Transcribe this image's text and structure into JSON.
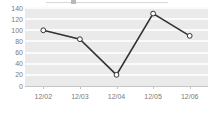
{
  "chart_data": {
    "type": "line",
    "title": "",
    "xlabel": "",
    "ylabel": "",
    "categories": [
      "12/02",
      "12/03",
      "12/04",
      "12/05",
      "12/06"
    ],
    "values": [
      100,
      84,
      20,
      130,
      90
    ],
    "series": [
      {
        "name": "",
        "values": [
          100,
          84,
          20,
          130,
          90
        ]
      }
    ],
    "ylim": [
      0,
      140
    ],
    "yticks": [
      0,
      20,
      40,
      60,
      80,
      100,
      120,
      140
    ],
    "ytick_labels": [
      "0",
      "20",
      "40",
      "60",
      "80",
      "100",
      "120",
      "140"
    ],
    "grid": true,
    "grid_axis": "y",
    "legend": false,
    "legend_position": "none",
    "marker": "open-circle",
    "line_color": "#333333",
    "marker_face_color": "#ffffff",
    "marker_edge_color": "#333333",
    "plot_background": "#eaeaea",
    "gridline_color": "#fbfbfb",
    "tick_label_color": "#7a7a7a",
    "annotations": []
  }
}
